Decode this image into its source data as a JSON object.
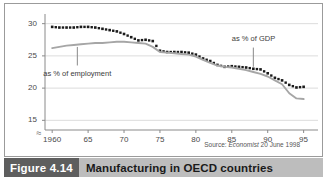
{
  "figure": {
    "caption_number": "Figure 4.14",
    "caption_title": "Manufacturing in OECD countries",
    "source_prefix": "Source:",
    "source_publication": "Economist",
    "source_date": "20 June 1998",
    "accent_bar_color": "#bdbdbd",
    "accent_num_color": "#5e5e5e"
  },
  "chart_data": {
    "type": "line",
    "title": "Manufacturing in OECD countries",
    "xlabel": "",
    "ylabel": "",
    "xlim": [
      1959,
      1997
    ],
    "ylim": [
      13.5,
      31.5
    ],
    "yticks": [
      15,
      20,
      25,
      30
    ],
    "ytick_labels": [
      "15",
      "20",
      "25",
      "30"
    ],
    "xticks": [
      1960,
      1965,
      1970,
      1975,
      1980,
      1985,
      1990,
      1995
    ],
    "xtick_labels": [
      "1960",
      "65",
      "70",
      "75",
      "80",
      "85",
      "90",
      "95"
    ],
    "grid": true,
    "grid_axis": "y",
    "axis_break": true,
    "axis_break_symbol": "≈",
    "legend_position": "inline-annotations",
    "annotations": [
      {
        "text": "as % of employment",
        "series": "as % of employment",
        "x": 1963.5,
        "y": 23.2
      },
      {
        "text": "as % of GDP",
        "series": "as % of GDP",
        "x": 1988.0,
        "y": 26.6
      }
    ],
    "x": [
      1960,
      1961,
      1962,
      1963,
      1964,
      1965,
      1966,
      1967,
      1968,
      1969,
      1970,
      1971,
      1972,
      1973,
      1974,
      1975,
      1976,
      1977,
      1978,
      1979,
      1980,
      1981,
      1982,
      1983,
      1984,
      1985,
      1986,
      1987,
      1988,
      1989,
      1990,
      1991,
      1992,
      1993,
      1994,
      1995
    ],
    "series": [
      {
        "name": "as % of GDP",
        "style": "dotted",
        "color": "#1a1a1a",
        "values": [
          29.5,
          29.4,
          29.4,
          29.4,
          29.5,
          29.5,
          29.4,
          29.2,
          29.0,
          28.8,
          28.4,
          27.9,
          27.4,
          27.5,
          27.3,
          25.8,
          25.6,
          25.6,
          25.6,
          25.5,
          25.2,
          24.6,
          24.2,
          23.6,
          23.3,
          23.4,
          23.3,
          23.2,
          23.0,
          22.9,
          22.3,
          21.6,
          21.2,
          20.5,
          20.1,
          20.2
        ]
      },
      {
        "name": "as % of employment",
        "style": "solid",
        "color": "#a6a6a6",
        "values": [
          26.2,
          26.4,
          26.6,
          26.7,
          26.8,
          26.9,
          27.0,
          27.0,
          27.1,
          27.2,
          27.2,
          27.1,
          27.0,
          26.9,
          26.4,
          25.6,
          25.5,
          25.4,
          25.3,
          25.2,
          24.9,
          24.4,
          23.9,
          23.5,
          23.3,
          23.2,
          23.0,
          22.8,
          22.5,
          22.2,
          21.8,
          21.2,
          20.6,
          19.2,
          18.4,
          18.3
        ]
      }
    ]
  }
}
